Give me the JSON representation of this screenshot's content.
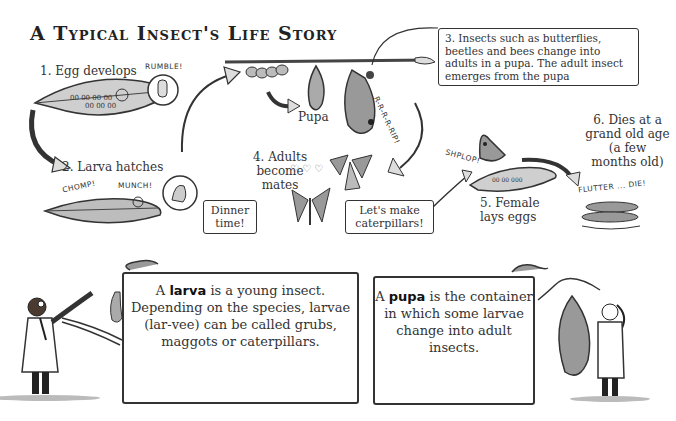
{
  "title": "A Typical Insect's Life Story",
  "stages": [
    {
      "id": 1,
      "label": "1. Egg develops",
      "sound": "RUMBLE!"
    },
    {
      "id": 2,
      "label": "2. Larva hatches",
      "sounds": [
        "CHOMP!",
        "MUNCH!"
      ],
      "speech": "Dinner time!"
    },
    {
      "id": 3,
      "label": "3. Insects such as butterflies, beetles and bees change into adults in a pupa. The adult insect emerges from the pupa",
      "pupa_label": "Pupa",
      "sound": "R-R-R-R-RIP!"
    },
    {
      "id": 4,
      "label": "4. Adults become mates",
      "speech": "Let's make caterpillars!"
    },
    {
      "id": 5,
      "label": "5. Female lays eggs",
      "sound": "SHPLOP!"
    },
    {
      "id": 6,
      "label": "6. Dies at a grand old age (a few months old)",
      "sound": "FLUTTER ... DIE!"
    }
  ],
  "info_boxes": {
    "larva": {
      "prefix": "A ",
      "term": "larva",
      "text": " is a young insect. Depending on the species, larvae (lar-vee) can be called grubs, maggots or caterpillars."
    },
    "pupa": {
      "prefix": "A ",
      "term": "pupa",
      "text": " is the container in which some larvae change into adult insects."
    }
  }
}
